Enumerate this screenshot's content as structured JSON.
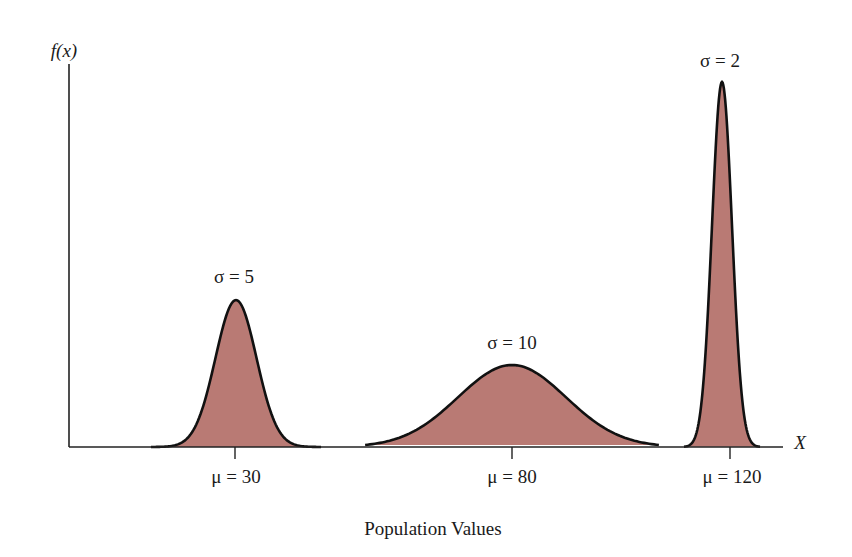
{
  "chart_data": {
    "type": "area",
    "title": "",
    "xlabel": "Population Values",
    "ylabel": "f(x)",
    "x_axis_symbol": "X",
    "grid": false,
    "legend": "none",
    "fill_color": "#b97a74",
    "stroke_color": "#111111",
    "series": [
      {
        "name": "σ = 5",
        "mean": 30,
        "sd": 5,
        "mean_label": "μ = 30",
        "sd_label": "σ = 5"
      },
      {
        "name": "σ = 10",
        "mean": 80,
        "sd": 10,
        "mean_label": "μ = 80",
        "sd_label": "σ = 10"
      },
      {
        "name": "σ = 2",
        "mean": 120,
        "sd": 2,
        "mean_label": "μ = 120",
        "sd_label": "σ = 2"
      }
    ],
    "x_ticks": [
      "μ = 30",
      "μ = 80",
      "μ = 120"
    ],
    "annotations": [
      "σ = 5",
      "σ = 10",
      "σ = 2"
    ]
  },
  "labels": {
    "y_axis": "f(x)",
    "x_axis": "X",
    "x_title": "Population Values",
    "sd5": "σ = 5",
    "sd10": "σ = 10",
    "sd2": "σ = 2",
    "mu30": "μ = 30",
    "mu80": "μ = 80",
    "mu120": "μ = 120"
  }
}
